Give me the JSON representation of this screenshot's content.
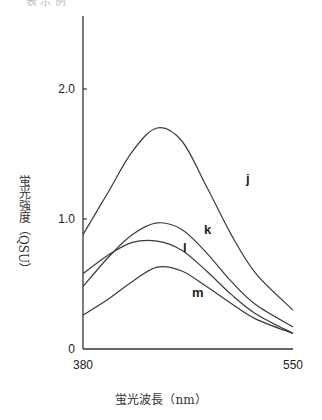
{
  "header_fragment": "表 示 例",
  "chart_data": {
    "type": "line",
    "title": "",
    "xlabel": "蛍光波長（nm）",
    "ylabel": "蛍光強度（QSU）",
    "xlim": [
      380,
      550
    ],
    "ylim": [
      0,
      2.5
    ],
    "x_ticks": [
      "380",
      "550"
    ],
    "y_ticks": [
      "0",
      "1.0",
      "2.0"
    ],
    "grid": false,
    "legend": "inline curve labels",
    "x": [
      380,
      400,
      420,
      440,
      460,
      480,
      500,
      520,
      550
    ],
    "series": [
      {
        "name": "j",
        "values": [
          0.88,
          1.2,
          1.52,
          1.7,
          1.6,
          1.25,
          0.88,
          0.58,
          0.3
        ]
      },
      {
        "name": "k",
        "values": [
          0.48,
          0.7,
          0.88,
          0.97,
          0.92,
          0.74,
          0.52,
          0.34,
          0.17
        ]
      },
      {
        "name": "l",
        "values": [
          0.58,
          0.72,
          0.82,
          0.83,
          0.76,
          0.6,
          0.42,
          0.27,
          0.12
        ]
      },
      {
        "name": "m",
        "values": [
          0.26,
          0.38,
          0.52,
          0.63,
          0.6,
          0.48,
          0.35,
          0.23,
          0.12
        ]
      }
    ]
  }
}
